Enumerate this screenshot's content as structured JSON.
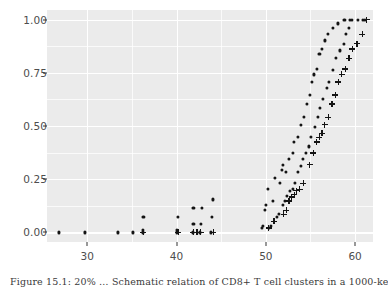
{
  "figure": {
    "background": "#ffffff",
    "panel_background": "#ebebeb",
    "grid_color": "#ffffff",
    "marker_color": "#141414",
    "axis_text_color": "#4d4d4d",
    "caption": "Figure 15.1: 20% … Schematic relation of CD8+ T cell clusters in a 1000-ke…"
  },
  "chart_data": {
    "type": "scatter",
    "title": "",
    "xlabel": "",
    "ylabel": "",
    "xlim": [
      25.5,
      62.0
    ],
    "ylim": [
      -0.045,
      1.045
    ],
    "xticks": [
      30,
      40,
      50,
      60
    ],
    "yticks": [
      0.0,
      0.25,
      0.5,
      0.75,
      1.0
    ],
    "xtick_labels": [
      "30",
      "40",
      "50",
      "60"
    ],
    "ytick_labels": [
      "0.00",
      "0.25",
      "0.50",
      "0.75",
      "1.00"
    ],
    "x_minor_ticks": [
      35,
      45,
      55
    ],
    "y_minor_ticks": [
      0.125,
      0.375,
      0.625,
      0.875
    ],
    "grid": true,
    "legend": false,
    "legend_position": "none",
    "series": [
      {
        "name": "series-1-dots",
        "marker": "dot",
        "points": [
          [
            26.8,
            0.0
          ],
          [
            29.8,
            0.0
          ],
          [
            33.4,
            0.0
          ],
          [
            35.1,
            0.0
          ],
          [
            36.2,
            0.0
          ],
          [
            36.2,
            0.012
          ],
          [
            36.3,
            0.073
          ],
          [
            40.1,
            0.0
          ],
          [
            40.1,
            0.012
          ],
          [
            40.2,
            0.073
          ],
          [
            41.8,
            0.0
          ],
          [
            41.9,
            0.038
          ],
          [
            41.9,
            0.116
          ],
          [
            42.6,
            0.0
          ],
          [
            42.7,
            0.038
          ],
          [
            42.8,
            0.116
          ],
          [
            43.9,
            0.0
          ],
          [
            44.0,
            0.073
          ],
          [
            44.1,
            0.155
          ],
          [
            49.6,
            0.022
          ],
          [
            49.7,
            0.032
          ],
          [
            49.9,
            0.104
          ],
          [
            50.0,
            0.127
          ],
          [
            50.2,
            0.203
          ],
          [
            50.8,
            0.148
          ],
          [
            51.0,
            0.257
          ],
          [
            51.6,
            0.231
          ],
          [
            51.8,
            0.292
          ],
          [
            51.9,
            0.319
          ],
          [
            52.3,
            0.283
          ],
          [
            52.6,
            0.346
          ],
          [
            53.0,
            0.373
          ],
          [
            53.2,
            0.425
          ],
          [
            53.6,
            0.447
          ],
          [
            53.9,
            0.506
          ],
          [
            54.3,
            0.541
          ],
          [
            54.6,
            0.604
          ],
          [
            54.9,
            0.646
          ],
          [
            55.2,
            0.707
          ],
          [
            55.4,
            0.742
          ],
          [
            55.7,
            0.768
          ],
          [
            56.0,
            0.838
          ],
          [
            56.3,
            0.862
          ],
          [
            56.6,
            0.902
          ],
          [
            57.0,
            0.931
          ],
          [
            57.5,
            0.959
          ],
          [
            58.1,
            0.982
          ],
          [
            58.8,
            1.0
          ],
          [
            59.4,
            1.0
          ],
          [
            60.9,
            1.0
          ]
        ]
      },
      {
        "name": "series-2-dots",
        "marker": "dot",
        "points": [
          [
            50.4,
            0.021
          ],
          [
            50.6,
            0.031
          ],
          [
            51.2,
            0.073
          ],
          [
            51.5,
            0.085
          ],
          [
            51.9,
            0.127
          ],
          [
            52.1,
            0.148
          ],
          [
            52.4,
            0.173
          ],
          [
            52.7,
            0.196
          ],
          [
            53.0,
            0.206
          ],
          [
            53.3,
            0.231
          ],
          [
            53.6,
            0.283
          ],
          [
            53.9,
            0.311
          ],
          [
            54.2,
            0.346
          ],
          [
            54.5,
            0.373
          ],
          [
            54.8,
            0.404
          ],
          [
            55.1,
            0.447
          ],
          [
            55.5,
            0.494
          ],
          [
            55.8,
            0.541
          ],
          [
            56.1,
            0.583
          ],
          [
            56.4,
            0.626
          ],
          [
            56.8,
            0.678
          ],
          [
            57.1,
            0.707
          ],
          [
            57.5,
            0.762
          ],
          [
            57.9,
            0.818
          ],
          [
            58.3,
            0.855
          ],
          [
            58.7,
            0.886
          ],
          [
            59.0,
            0.931
          ],
          [
            59.3,
            0.959
          ],
          [
            59.6,
            1.0
          ],
          [
            60.3,
            1.0
          ],
          [
            61.1,
            1.0
          ]
        ]
      },
      {
        "name": "series-3-plus",
        "marker": "plus",
        "points": [
          [
            36.3,
            0.0
          ],
          [
            40.2,
            0.0
          ],
          [
            41.9,
            0.0
          ],
          [
            42.3,
            0.0
          ],
          [
            42.7,
            0.0
          ],
          [
            44.1,
            0.0
          ],
          [
            50.3,
            0.021
          ],
          [
            50.9,
            0.052
          ],
          [
            52.0,
            0.085
          ],
          [
            52.3,
            0.104
          ],
          [
            52.6,
            0.148
          ],
          [
            52.9,
            0.166
          ],
          [
            53.2,
            0.178
          ],
          [
            53.4,
            0.196
          ],
          [
            53.8,
            0.203
          ],
          [
            54.2,
            0.231
          ],
          [
            54.9,
            0.319
          ],
          [
            55.3,
            0.373
          ],
          [
            55.7,
            0.425
          ],
          [
            56.0,
            0.447
          ],
          [
            56.3,
            0.466
          ],
          [
            56.6,
            0.506
          ],
          [
            57.0,
            0.541
          ],
          [
            57.4,
            0.604
          ],
          [
            57.8,
            0.646
          ],
          [
            58.1,
            0.707
          ],
          [
            58.5,
            0.742
          ],
          [
            58.9,
            0.768
          ],
          [
            59.3,
            0.818
          ],
          [
            59.7,
            0.862
          ],
          [
            60.2,
            0.886
          ],
          [
            60.8,
            0.931
          ],
          [
            61.3,
            1.0
          ]
        ]
      }
    ]
  }
}
